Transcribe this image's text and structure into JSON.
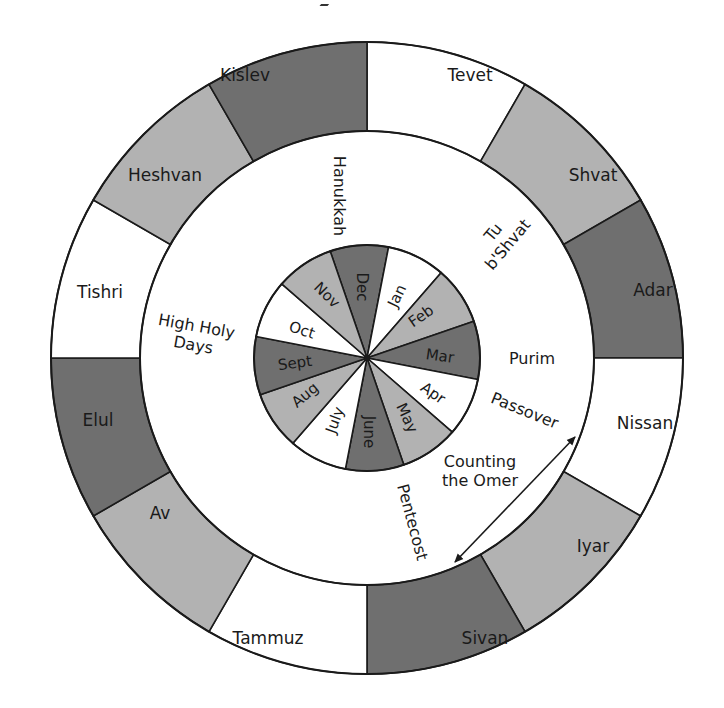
{
  "diagram": {
    "center": [
      367,
      358
    ],
    "outer_radius": 316,
    "ring_inner_radius": 227,
    "pie_radius": 113,
    "colors": {
      "white": "#ffffff",
      "light": "#b2b2b2",
      "dark": "#6f6f6f",
      "stroke": "#1a1a1a"
    },
    "hebrew_months": [
      {
        "name": "Tevet",
        "start": 0,
        "shade": "white",
        "label_pos": [
          470,
          81
        ]
      },
      {
        "name": "Shvat",
        "start": 30,
        "shade": "light",
        "label_pos": [
          593,
          181
        ]
      },
      {
        "name": "Adar",
        "start": 60,
        "shade": "dark",
        "label_pos": [
          653,
          296
        ]
      },
      {
        "name": "Nissan",
        "start": 90,
        "shade": "white",
        "label_pos": [
          645,
          429
        ]
      },
      {
        "name": "Iyar",
        "start": 120,
        "shade": "light",
        "label_pos": [
          593,
          552
        ]
      },
      {
        "name": "Sivan",
        "start": 150,
        "shade": "dark",
        "label_pos": [
          485,
          644
        ]
      },
      {
        "name": "Tammuz",
        "start": 180,
        "shade": "white",
        "label_pos": [
          268,
          644
        ]
      },
      {
        "name": "Av",
        "start": 210,
        "shade": "light",
        "label_pos": [
          160,
          519
        ]
      },
      {
        "name": "Elul",
        "start": 240,
        "shade": "dark",
        "label_pos": [
          98,
          426
        ]
      },
      {
        "name": "Tishri",
        "start": 270,
        "shade": "white",
        "label_pos": [
          100,
          298
        ]
      },
      {
        "name": "Heshvan",
        "start": 300,
        "shade": "light",
        "label_pos": [
          165,
          181
        ]
      },
      {
        "name": "Kislev",
        "start": 330,
        "shade": "dark",
        "label_pos": [
          245,
          81
        ]
      }
    ],
    "gregorian_months": [
      {
        "name": "Dec",
        "start": -19,
        "shade": "dark",
        "label_pos": [
          362,
          287
        ],
        "rotate": 90
      },
      {
        "name": "Jan",
        "start": 11,
        "shade": "white",
        "label_pos": [
          397,
          296
        ],
        "rotate": -64
      },
      {
        "name": "Feb",
        "start": 41,
        "shade": "light",
        "label_pos": [
          421,
          316
        ],
        "rotate": -35
      },
      {
        "name": "Mar",
        "start": 71,
        "shade": "dark",
        "label_pos": [
          440,
          356
        ],
        "rotate": 8
      },
      {
        "name": "Apr",
        "start": 101,
        "shade": "white",
        "label_pos": [
          433,
          393
        ],
        "rotate": 35
      },
      {
        "name": "May",
        "start": 131,
        "shade": "light",
        "label_pos": [
          407,
          418
        ],
        "rotate": 65
      },
      {
        "name": "June",
        "start": 161,
        "shade": "dark",
        "label_pos": [
          369,
          432
        ],
        "rotate": 90
      },
      {
        "name": "July",
        "start": 191,
        "shade": "white",
        "label_pos": [
          335,
          420
        ],
        "rotate": -70
      },
      {
        "name": "Aug",
        "start": 221,
        "shade": "light",
        "label_pos": [
          305,
          395
        ],
        "rotate": -40
      },
      {
        "name": "Sept",
        "start": 251,
        "shade": "dark",
        "label_pos": [
          295,
          363
        ],
        "rotate": -8
      },
      {
        "name": "Oct",
        "start": 281,
        "shade": "white",
        "label_pos": [
          302,
          330
        ],
        "rotate": 18
      },
      {
        "name": "Nov",
        "start": 311,
        "shade": "light",
        "label_pos": [
          327,
          295
        ],
        "rotate": 45
      }
    ],
    "holidays": [
      {
        "lines": [
          "Hanukkah"
        ],
        "label_pos": [
          340,
          196
        ],
        "rotate": 90
      },
      {
        "lines": [
          "Tu",
          "b'Shvat"
        ],
        "label_pos": [
          500,
          238
        ],
        "rotate": -50
      },
      {
        "lines": [
          "High Holy",
          "Days"
        ],
        "label_pos": [
          195,
          335
        ],
        "rotate": 10
      },
      {
        "lines": [
          "Purim"
        ],
        "label_pos": [
          532,
          358
        ],
        "rotate": 0
      },
      {
        "lines": [
          "Passover"
        ],
        "label_pos": [
          525,
          410
        ],
        "rotate": 22
      },
      {
        "lines": [
          "Counting",
          "the Omer"
        ],
        "label_pos": [
          480,
          470
        ],
        "rotate": 0
      },
      {
        "lines": [
          "Pentecost"
        ],
        "label_pos": [
          413,
          522
        ],
        "rotate": 75
      }
    ],
    "omer_arrow": {
      "from": [
        455,
        562
      ],
      "to": [
        575,
        437
      ]
    }
  }
}
